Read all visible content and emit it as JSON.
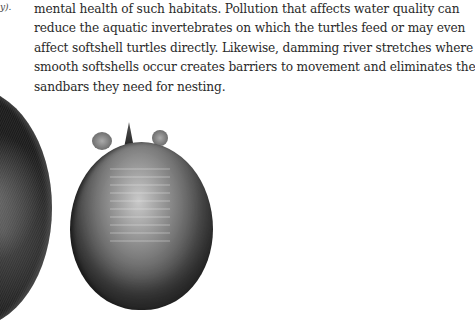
{
  "caption_fragment": "y).",
  "paragraph": {
    "lines": [
      "mental health of such habitats. Pollution that affects water quality can",
      "reduce the aquatic invertebrates on which the turtles feed or may even",
      "affect softshell turtles directly. Likewise, damming river stretches where",
      "smooth softshells occur creates barriers to movement and eliminates the",
      "sandbars they need for nesting."
    ]
  },
  "figures": [
    {
      "name": "left-shell-photo",
      "description": "Dark carapace of a softshell turtle (partially cropped)"
    },
    {
      "name": "right-shell-photo",
      "description": "Smooth softshell turtle shell, dorsal view"
    }
  ]
}
